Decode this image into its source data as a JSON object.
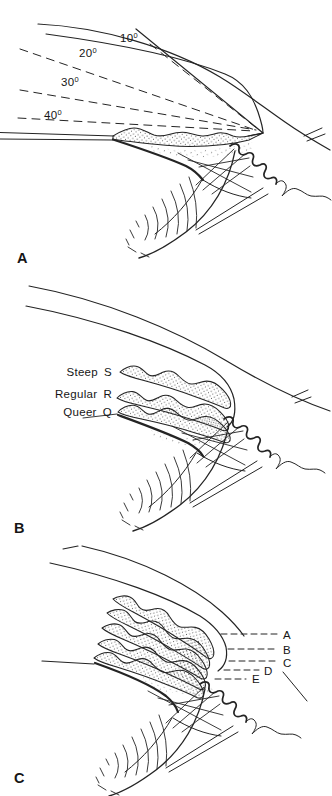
{
  "ink": "#242424",
  "background": "#ffffff",
  "panel_a": {
    "label": "A",
    "angle_labels": [
      {
        "value": "10",
        "sup": "0"
      },
      {
        "value": "20",
        "sup": "0"
      },
      {
        "value": "30",
        "sup": "0"
      },
      {
        "value": "40",
        "sup": "0"
      }
    ]
  },
  "panel_b": {
    "label": "B",
    "iris_labels": [
      {
        "name": "Steep",
        "code": "S"
      },
      {
        "name": "Regular",
        "code": "R"
      },
      {
        "name": "Queer",
        "code": "Q"
      }
    ]
  },
  "panel_c": {
    "label": "C",
    "insertion_labels": [
      "A",
      "B",
      "C",
      "D",
      "E"
    ]
  }
}
